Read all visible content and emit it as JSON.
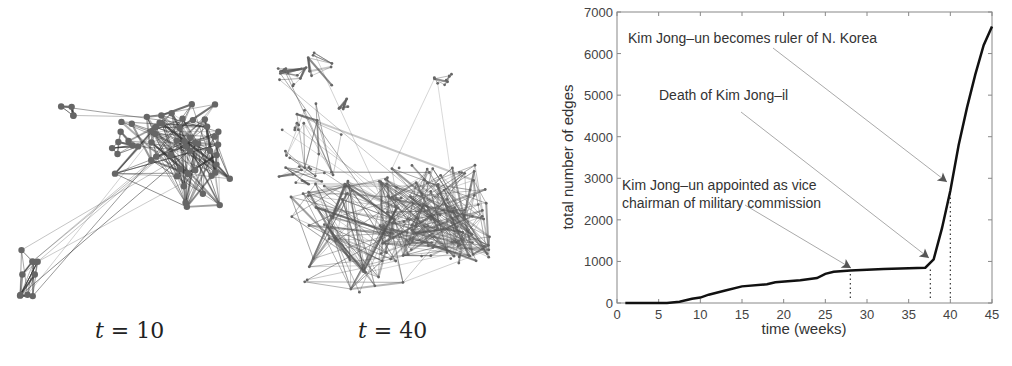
{
  "networks": [
    {
      "label_var": "t",
      "label_eq": "=",
      "label_value": "10"
    },
    {
      "label_var": "t",
      "label_eq": "=",
      "label_value": "40"
    }
  ],
  "chart_data": {
    "type": "line",
    "title": "",
    "xlabel": "time (weeks)",
    "ylabel": "total number of edges",
    "xlim": [
      0,
      45
    ],
    "ylim": [
      0,
      7000
    ],
    "xticks": [
      0,
      5,
      10,
      15,
      20,
      25,
      30,
      35,
      40,
      45
    ],
    "yticks": [
      0,
      1000,
      2000,
      3000,
      4000,
      5000,
      6000,
      7000
    ],
    "grid": false,
    "series": [
      {
        "name": "total edges",
        "x": [
          1,
          6,
          7.5,
          9,
          10,
          11,
          13,
          15,
          18,
          19,
          22,
          24,
          25,
          26,
          28,
          30,
          32,
          37,
          38,
          39,
          40,
          41,
          42,
          43,
          44,
          45
        ],
        "values": [
          0,
          0,
          30,
          100,
          130,
          200,
          300,
          400,
          450,
          500,
          550,
          600,
          700,
          750,
          780,
          800,
          820,
          850,
          1050,
          1800,
          2700,
          3800,
          4700,
          5500,
          6200,
          6650
        ]
      }
    ],
    "annotations": [
      {
        "text_lines": [
          "Kim Jong–un appointed as vice",
          "chairman of military commission"
        ],
        "x": 28,
        "y": 780
      },
      {
        "text_lines": [
          "Death of Kim Jong–il"
        ],
        "x": 37.6,
        "y": 1050
      },
      {
        "text_lines": [
          "Kim Jong–un becomes ruler of N. Korea"
        ],
        "x": 40,
        "y": 2900
      }
    ],
    "vlines": [
      28,
      37.6,
      40
    ]
  }
}
